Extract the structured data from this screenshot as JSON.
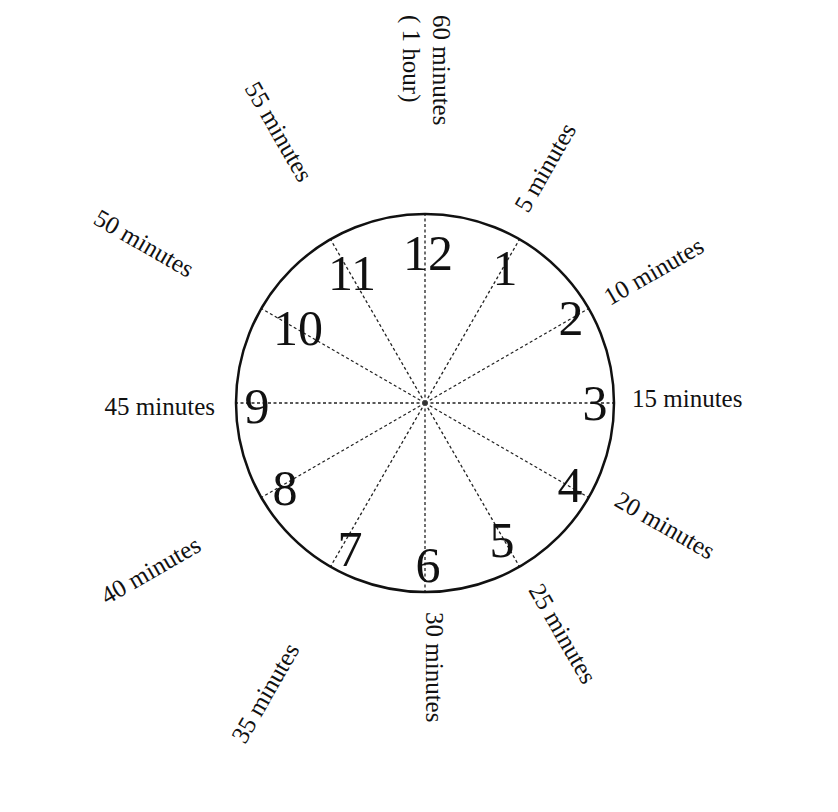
{
  "diagram": {
    "type": "clock-face",
    "colors": {
      "ink": "#111111",
      "background": "#ffffff"
    },
    "clock": {
      "cx": 425,
      "cy": 403,
      "r": 189
    },
    "numbers": [
      {
        "text": "12",
        "x": 428,
        "y": 270
      },
      {
        "text": "1",
        "x": 505,
        "y": 285
      },
      {
        "text": "2",
        "x": 571,
        "y": 335
      },
      {
        "text": "3",
        "x": 595,
        "y": 420
      },
      {
        "text": "4",
        "x": 570,
        "y": 502
      },
      {
        "text": "5",
        "x": 502,
        "y": 557
      },
      {
        "text": "6",
        "x": 428,
        "y": 582
      },
      {
        "text": "7",
        "x": 350,
        "y": 566
      },
      {
        "text": "8",
        "x": 285,
        "y": 505
      },
      {
        "text": "9",
        "x": 257,
        "y": 423
      },
      {
        "text": "10",
        "x": 298,
        "y": 345
      },
      {
        "text": "11",
        "x": 352,
        "y": 290
      }
    ],
    "labels": [
      {
        "text": "60 minutes",
        "x": 433,
        "y": 15,
        "rot": 90,
        "anchor": "start"
      },
      {
        "text": "( 1 hour)",
        "x": 403,
        "y": 15,
        "rot": 90,
        "anchor": "start"
      },
      {
        "text": "5 minutes",
        "x": 528,
        "y": 214,
        "rot": -60,
        "anchor": "start"
      },
      {
        "text": "10 minutes",
        "x": 610,
        "y": 306,
        "rot": -30,
        "anchor": "start"
      },
      {
        "text": "15 minutes",
        "x": 632,
        "y": 407,
        "rot": 0,
        "anchor": "start"
      },
      {
        "text": "20 minutes",
        "x": 613,
        "y": 505,
        "rot": 30,
        "anchor": "start"
      },
      {
        "text": "25 minutes",
        "x": 528,
        "y": 590,
        "rot": 60,
        "anchor": "start"
      },
      {
        "text": "30 minutes",
        "x": 426,
        "y": 612,
        "rot": 90,
        "anchor": "start"
      },
      {
        "text": "35 minutes",
        "x": 245,
        "y": 745,
        "rot": -60,
        "anchor": "start"
      },
      {
        "text": "40 minutes",
        "x": 107,
        "y": 605,
        "rot": -30,
        "anchor": "start"
      },
      {
        "text": "45 minutes",
        "x": 215,
        "y": 415,
        "rot": 0,
        "anchor": "end"
      },
      {
        "text": "50 minutes",
        "x": 92,
        "y": 223,
        "rot": 30,
        "anchor": "start"
      },
      {
        "text": "55 minutes",
        "x": 244,
        "y": 88,
        "rot": 60,
        "anchor": "start"
      }
    ]
  }
}
